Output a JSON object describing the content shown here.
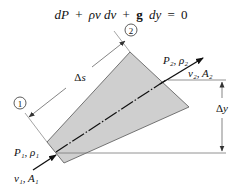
{
  "equation": {
    "dP": "dP",
    "plus1": "+",
    "rho_v_dv": "ρv dv",
    "plus2": "+",
    "g": "g",
    "dy": "dy",
    "equals": "=",
    "zero": "0"
  },
  "stations": {
    "section1": {
      "marker": "1",
      "pressure_density": "P₁, ρ₁",
      "velocity_area": "v₁, A₁"
    },
    "section2": {
      "marker": "2",
      "pressure_density": "P₂, ρ₂",
      "velocity_area": "v₂, A₂"
    }
  },
  "dimensions": {
    "length_label": "Δs",
    "height_label": "Δy"
  },
  "colors": {
    "fill": "#cfcfcf",
    "stroke": "#555555",
    "line": "#333333",
    "text": "#111111"
  }
}
